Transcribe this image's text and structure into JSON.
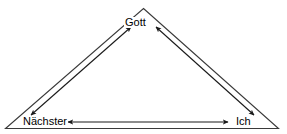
{
  "diagram": {
    "type": "triangle-relationship-diagram",
    "language": "de",
    "background_color": "#ffffff",
    "line_color": "#1a1a1a",
    "text_color": "#000000",
    "vertices": [
      {
        "id": "gott",
        "label": "Gott",
        "position": "top-apex"
      },
      {
        "id": "naechster",
        "label": "Nächster",
        "position": "bottom-left"
      },
      {
        "id": "ich",
        "label": "Ich",
        "position": "bottom-right"
      }
    ],
    "edges": [
      {
        "id": "edge-naechster-gott",
        "from": "Nächster",
        "to": "Gott",
        "arrow": "double"
      },
      {
        "id": "edge-gott-ich",
        "from": "Gott",
        "to": "Ich",
        "arrow": "double"
      },
      {
        "id": "edge-ich-naechster",
        "from": "Ich",
        "to": "Nächster",
        "arrow": "double"
      }
    ]
  }
}
